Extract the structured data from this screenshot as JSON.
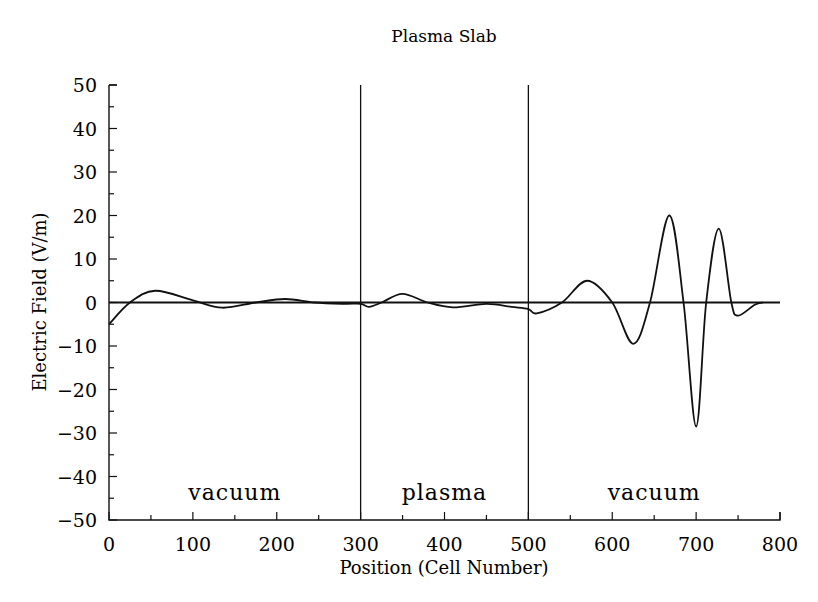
{
  "chart_data": {
    "type": "line",
    "title": "Plasma Slab",
    "xlabel": "Position  (Cell Number)",
    "ylabel": "Electric Field (V/m)",
    "xlim": [
      0,
      800
    ],
    "ylim": [
      -50,
      50
    ],
    "grid": false,
    "legend": null,
    "x_ticks": [
      "0",
      "100",
      "200",
      "300",
      "400",
      "500",
      "600",
      "700",
      "800"
    ],
    "y_ticks": [
      "50",
      "40",
      "30",
      "20",
      "10",
      "0",
      "−10",
      "−20",
      "−30",
      "−40",
      "−50"
    ],
    "boundaries": [
      300,
      500
    ],
    "regions": [
      {
        "label": "vacuum",
        "x_start": 0,
        "x_end": 300
      },
      {
        "label": "plasma",
        "x_start": 300,
        "x_end": 500
      },
      {
        "label": "vacuum",
        "x_start": 500,
        "x_end": 800
      }
    ],
    "series": [
      {
        "name": "Electric Field",
        "x": [
          0,
          25,
          55,
          100,
          135,
          175,
          210,
          245,
          280,
          300,
          310,
          325,
          350,
          380,
          410,
          450,
          480,
          500,
          510,
          540,
          570,
          600,
          625,
          645,
          668,
          685,
          700,
          712,
          727,
          742,
          750,
          770,
          780
        ],
        "values": [
          -5,
          0,
          2.7,
          0.5,
          -1.2,
          0,
          0.8,
          0,
          -0.3,
          -0.3,
          -1,
          0,
          2,
          0,
          -1.1,
          -0.3,
          -1,
          -1.5,
          -2.5,
          0,
          5,
          0,
          -9.5,
          0,
          20,
          0,
          -28.5,
          0,
          17,
          0,
          -3,
          -0.5,
          0
        ]
      }
    ]
  }
}
